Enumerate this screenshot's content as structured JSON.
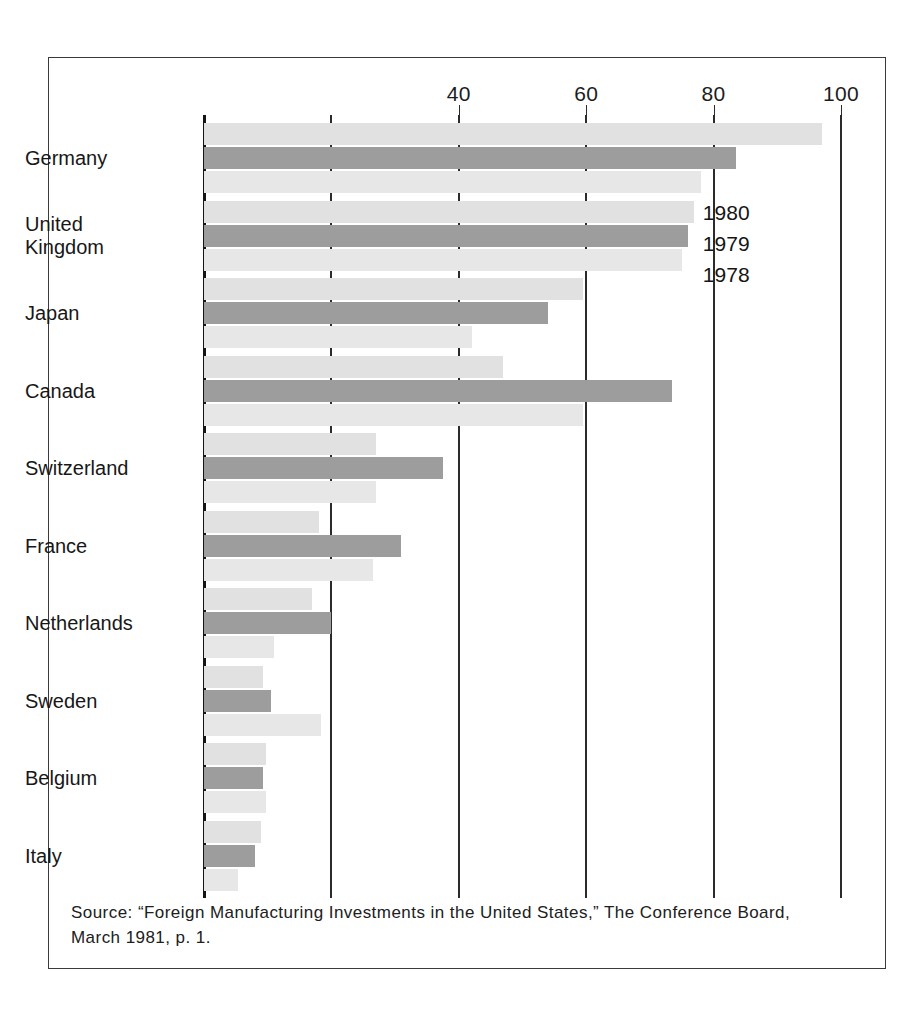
{
  "chart_data": {
    "type": "bar",
    "orientation": "horizontal",
    "title": "",
    "subtitle": "",
    "xlabel": "",
    "ylabel": "",
    "xlim": [
      0,
      100
    ],
    "tick_labels": [
      "40",
      "60",
      "80",
      "100"
    ],
    "tick_values": [
      40,
      60,
      80,
      100
    ],
    "gridline_values": [
      0,
      20,
      40,
      60,
      80,
      100
    ],
    "grid": true,
    "legend_position": "inside-right-upper",
    "legend": [
      "1980",
      "1979",
      "1978"
    ],
    "categories": [
      "Germany",
      "United Kingdom",
      "Japan",
      "Canada",
      "Switzerland",
      "France",
      "Netherlands",
      "Sweden",
      "Belgium",
      "Italy"
    ],
    "series": [
      {
        "name": "1980",
        "color": "#e1e1e1",
        "values": [
          97,
          77,
          59.5,
          47,
          27,
          18,
          17,
          9.2,
          9.7,
          9
        ]
      },
      {
        "name": "1979",
        "color": "#9d9d9d",
        "values": [
          83.5,
          76,
          54,
          73.5,
          37.5,
          31,
          20,
          10.5,
          9.2,
          8
        ]
      },
      {
        "name": "1978",
        "color": "#e7e7e7",
        "values": [
          78,
          75,
          42,
          59.5,
          27,
          26.5,
          11,
          18.4,
          9.7,
          5.3
        ]
      }
    ]
  },
  "footer": {
    "source_line1": "Source: “Foreign Manufacturing Investments in the United States,” The Conference Board,",
    "source_line2": "March 1981, p. 1."
  }
}
